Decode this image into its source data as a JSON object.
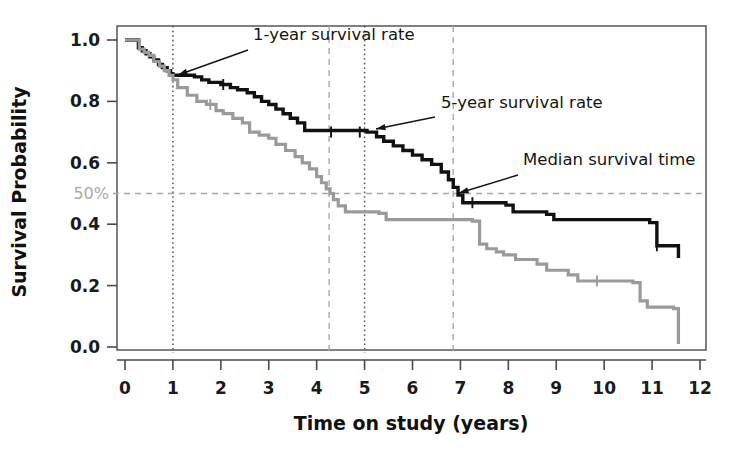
{
  "figure": {
    "background": "#ffffff",
    "plot_frame_color": "#4a4a4a"
  },
  "chart_data": {
    "type": "line",
    "subtype": "kaplan-meier-survival-curve",
    "title": "",
    "xlabel": "Time on study (years)",
    "ylabel": "Survival Probability",
    "xlim": [
      0,
      12
    ],
    "ylim": [
      0.0,
      1.0
    ],
    "xticks": [
      0,
      1,
      2,
      3,
      4,
      5,
      6,
      7,
      8,
      9,
      10,
      11,
      12
    ],
    "xtick_labels": [
      "0",
      "1",
      "2",
      "3",
      "4",
      "5",
      "6",
      "7",
      "8",
      "9",
      "10",
      "11",
      "12"
    ],
    "yticks": [
      0.0,
      0.2,
      0.4,
      0.6,
      0.8,
      1.0
    ],
    "ytick_labels": [
      "0.0",
      "0.2",
      "0.4",
      "0.6",
      "0.8",
      "1.0"
    ],
    "grid": false,
    "legend": "none",
    "series": [
      {
        "name": "upper-survival-curve",
        "color": "#111111",
        "line_width": 3.4,
        "step": "post",
        "x": [
          0.0,
          0.18,
          0.28,
          0.36,
          0.44,
          0.52,
          0.6,
          0.7,
          0.78,
          0.88,
          0.95,
          1.0,
          1.45,
          1.6,
          1.75,
          2.0,
          2.2,
          2.35,
          2.55,
          2.7,
          2.85,
          3.0,
          3.15,
          3.3,
          3.45,
          3.6,
          3.75,
          5.05,
          5.25,
          5.4,
          5.6,
          5.8,
          6.0,
          6.2,
          6.4,
          6.6,
          6.75,
          6.85,
          6.95,
          7.05,
          7.95,
          8.1,
          8.8,
          8.95,
          10.95,
          11.1,
          11.55
        ],
        "y": [
          1.0,
          1.0,
          0.975,
          0.965,
          0.955,
          0.945,
          0.935,
          0.92,
          0.91,
          0.9,
          0.89,
          0.885,
          0.88,
          0.87,
          0.862,
          0.855,
          0.845,
          0.838,
          0.828,
          0.815,
          0.8,
          0.79,
          0.775,
          0.76,
          0.745,
          0.73,
          0.705,
          0.7,
          0.685,
          0.67,
          0.655,
          0.64,
          0.625,
          0.61,
          0.595,
          0.57,
          0.545,
          0.52,
          0.495,
          0.47,
          0.462,
          0.44,
          0.432,
          0.415,
          0.405,
          0.33,
          0.29
        ],
        "censor_marks_x": [
          2.05,
          4.3,
          4.9,
          7.25,
          11.1
        ],
        "censor_marks_y": [
          0.855,
          0.7,
          0.7,
          0.47,
          0.33
        ]
      },
      {
        "name": "lower-survival-curve",
        "color": "#9a9a9a",
        "line_width": 3.2,
        "step": "post",
        "x": [
          0.0,
          0.18,
          0.3,
          0.4,
          0.5,
          0.6,
          0.72,
          0.82,
          0.92,
          1.0,
          1.1,
          1.3,
          1.5,
          1.7,
          1.9,
          2.05,
          2.25,
          2.45,
          2.6,
          2.8,
          3.0,
          3.15,
          3.35,
          3.55,
          3.7,
          3.85,
          4.0,
          4.1,
          4.2,
          4.28,
          4.35,
          4.45,
          4.6,
          5.3,
          5.45,
          7.25,
          7.4,
          7.55,
          7.75,
          7.9,
          8.15,
          8.6,
          8.8,
          9.25,
          9.45,
          10.6,
          10.75,
          10.9,
          11.45,
          11.55
        ],
        "y": [
          1.0,
          1.0,
          0.97,
          0.96,
          0.95,
          0.93,
          0.915,
          0.9,
          0.885,
          0.87,
          0.845,
          0.82,
          0.8,
          0.79,
          0.77,
          0.76,
          0.745,
          0.73,
          0.7,
          0.69,
          0.68,
          0.66,
          0.64,
          0.62,
          0.6,
          0.58,
          0.555,
          0.535,
          0.515,
          0.5,
          0.48,
          0.46,
          0.44,
          0.435,
          0.415,
          0.41,
          0.335,
          0.32,
          0.31,
          0.3,
          0.285,
          0.27,
          0.25,
          0.235,
          0.215,
          0.21,
          0.15,
          0.13,
          0.125,
          0.01
        ],
        "censor_marks_x": [
          1.78,
          9.85
        ],
        "censor_marks_y": [
          0.79,
          0.215
        ]
      }
    ],
    "reference_lines": [
      {
        "name": "one-year-reference",
        "orientation": "vertical",
        "value": 1.0,
        "style": "dotted",
        "color": "#555555"
      },
      {
        "name": "five-year-reference",
        "orientation": "vertical",
        "value": 5.0,
        "style": "dotted",
        "color": "#555555"
      },
      {
        "name": "median-lower-reference",
        "orientation": "vertical",
        "value": 4.26,
        "style": "dashed",
        "color": "#a8a8a8"
      },
      {
        "name": "median-upper-reference",
        "orientation": "vertical",
        "value": 6.85,
        "style": "dashed",
        "color": "#a8a8a8"
      },
      {
        "name": "fifty-percent-reference",
        "orientation": "horizontal",
        "value": 0.5,
        "style": "dashed",
        "color": "#a8a8a8",
        "label": "50%"
      }
    ],
    "annotations": [
      {
        "name": "one-year-survival-rate",
        "text": "1-year survival rate",
        "text_x": 253,
        "text_y": 40,
        "arrow_from_x": 248,
        "arrow_from_y": 50,
        "arrow_to_x": 178,
        "arrow_to_y": 75
      },
      {
        "name": "five-year-survival-rate",
        "text": "5-year survival rate",
        "text_x": 441,
        "text_y": 108,
        "arrow_from_x": 435,
        "arrow_from_y": 117,
        "arrow_to_x": 376,
        "arrow_to_y": 129
      },
      {
        "name": "median-survival-time",
        "text": "Median survival time",
        "text_x": 523,
        "text_y": 165,
        "arrow_from_x": 518,
        "arrow_from_y": 175,
        "arrow_to_x": 459,
        "arrow_to_y": 193
      }
    ]
  }
}
